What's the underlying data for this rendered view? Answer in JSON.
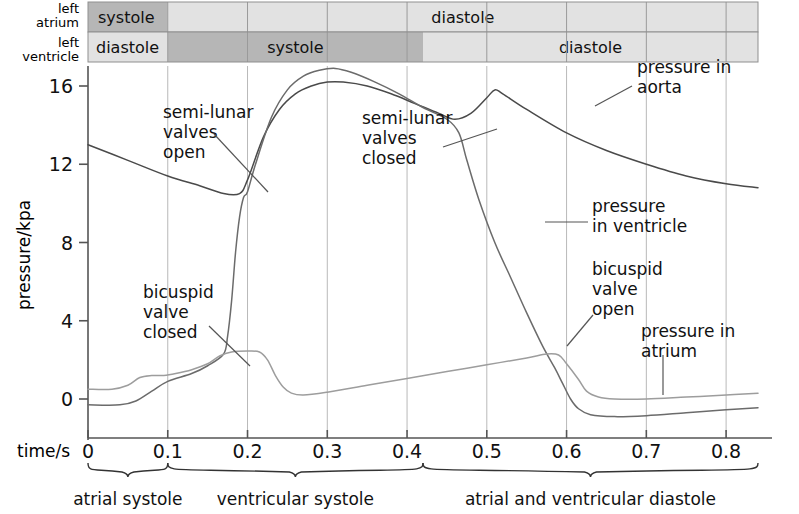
{
  "figure": {
    "axes": {
      "ylabel": "pressure/kpa",
      "xlabel": "time/s",
      "yticks": [
        "0",
        "4",
        "8",
        "12",
        "16"
      ],
      "xticks": [
        "0",
        "0.1",
        "0.2",
        "0.3",
        "0.4",
        "0.5",
        "0.6",
        "0.7",
        "0.8"
      ],
      "ylim": [
        -1.6,
        18.2
      ],
      "xlim": [
        0,
        0.84
      ]
    },
    "phase_rows": [
      {
        "row_label": "left atrium",
        "row_label_line1": "left",
        "row_label_line2": "atrium",
        "segments": [
          {
            "label": "systole",
            "start": 0.0,
            "end": 0.1,
            "shade": "dark"
          },
          {
            "label": "diastole",
            "start": 0.1,
            "end": 0.84,
            "shade": "light"
          }
        ]
      },
      {
        "row_label": "left ventricle",
        "row_label_line1": "left",
        "row_label_line2": "ventricle",
        "segments": [
          {
            "label": "diastole",
            "start": 0.0,
            "end": 0.1,
            "shade": "light"
          },
          {
            "label": "systole",
            "start": 0.1,
            "end": 0.42,
            "shade": "dark"
          },
          {
            "label": "diastole",
            "start": 0.42,
            "end": 0.84,
            "shade": "light"
          }
        ]
      }
    ],
    "phase_brackets": [
      {
        "label": "atrial systole",
        "start": 0.0,
        "end": 0.1
      },
      {
        "label": "ventricular systole",
        "start": 0.1,
        "end": 0.42
      },
      {
        "label": "atrial and ventricular diastole",
        "start": 0.42,
        "end": 0.84
      }
    ],
    "annotations": [
      {
        "id": "semi-lunar-valves-open",
        "lines": [
          "semi-lunar",
          "valves",
          "open"
        ],
        "text_x": 163,
        "text_y": 118,
        "leader": [
          [
            214,
            134
          ],
          [
            268,
            192
          ]
        ]
      },
      {
        "id": "semi-lunar-valves-closed",
        "lines": [
          "semi-lunar",
          "valves",
          "closed"
        ],
        "text_x": 362,
        "text_y": 124,
        "leader": [
          [
            443,
            147
          ],
          [
            497,
            129
          ]
        ]
      },
      {
        "id": "bicuspid-valve-closed",
        "lines": [
          "bicuspid",
          "valve",
          "closed"
        ],
        "text_x": 143,
        "text_y": 298,
        "leader": [
          [
            209,
            326
          ],
          [
            250,
            366
          ]
        ]
      },
      {
        "id": "bicuspid-valve-open",
        "lines": [
          "bicuspid",
          "valve",
          "open"
        ],
        "text_x": 592,
        "text_y": 275,
        "leader": [
          [
            593,
            315
          ],
          [
            567,
            346
          ]
        ]
      },
      {
        "id": "pressure-in-aorta",
        "lines": [
          "pressure in",
          "aorta"
        ],
        "text_x": 637,
        "text_y": 73,
        "leader": [
          [
            632,
            86
          ],
          [
            595,
            106
          ]
        ]
      },
      {
        "id": "pressure-in-ventricle",
        "lines": [
          "pressure",
          "in ventricle"
        ],
        "text_x": 592,
        "text_y": 212,
        "leader": [
          [
            588,
            222
          ],
          [
            545,
            222
          ]
        ]
      },
      {
        "id": "pressure-in-atrium",
        "lines": [
          "pressure in",
          "atrium"
        ],
        "text_x": 641,
        "text_y": 337,
        "leader": [
          [
            663,
            355
          ],
          [
            663,
            395
          ]
        ]
      }
    ],
    "chart_data": {
      "type": "line",
      "title": "Pressure changes in the left atrium, left ventricle and aorta during one cardiac cycle",
      "xlabel": "time/s",
      "ylabel": "pressure/kpa",
      "xlim": [
        0,
        0.84
      ],
      "ylim": [
        -1.6,
        18.2
      ],
      "xticks": [
        0,
        0.1,
        0.2,
        0.3,
        0.4,
        0.5,
        0.6,
        0.7,
        0.8
      ],
      "yticks": [
        0,
        4,
        8,
        12,
        16
      ],
      "grid": "vertical gridlines at each 0.1 s tick",
      "legend": "inline annotations (no legend box)",
      "series": [
        {
          "name": "pressure in aorta",
          "color": "#4a4a4a",
          "points": [
            [
              0.0,
              13.0
            ],
            [
              0.05,
              12.2
            ],
            [
              0.1,
              11.4
            ],
            [
              0.14,
              10.9
            ],
            [
              0.17,
              10.5
            ],
            [
              0.19,
              10.5
            ],
            [
              0.2,
              11.2
            ],
            [
              0.22,
              13.4
            ],
            [
              0.24,
              14.8
            ],
            [
              0.26,
              15.6
            ],
            [
              0.28,
              16.0
            ],
            [
              0.3,
              16.2
            ],
            [
              0.32,
              16.2
            ],
            [
              0.35,
              16.0
            ],
            [
              0.38,
              15.6
            ],
            [
              0.41,
              15.1
            ],
            [
              0.44,
              14.6
            ],
            [
              0.46,
              14.3
            ],
            [
              0.48,
              14.6
            ],
            [
              0.5,
              15.4
            ],
            [
              0.51,
              15.8
            ],
            [
              0.52,
              15.6
            ],
            [
              0.55,
              14.8
            ],
            [
              0.6,
              13.6
            ],
            [
              0.65,
              12.7
            ],
            [
              0.7,
              12.0
            ],
            [
              0.75,
              11.4
            ],
            [
              0.8,
              11.0
            ],
            [
              0.84,
              10.8
            ]
          ]
        },
        {
          "name": "pressure in ventricle",
          "color": "#6b6b6b",
          "points": [
            [
              0.0,
              -0.3
            ],
            [
              0.04,
              -0.3
            ],
            [
              0.06,
              -0.1
            ],
            [
              0.08,
              0.4
            ],
            [
              0.1,
              0.9
            ],
            [
              0.13,
              1.3
            ],
            [
              0.15,
              1.7
            ],
            [
              0.17,
              2.3
            ],
            [
              0.175,
              3.2
            ],
            [
              0.18,
              5.0
            ],
            [
              0.185,
              7.5
            ],
            [
              0.19,
              9.3
            ],
            [
              0.195,
              10.3
            ],
            [
              0.2,
              10.6
            ],
            [
              0.21,
              12.0
            ],
            [
              0.23,
              14.4
            ],
            [
              0.25,
              15.8
            ],
            [
              0.27,
              16.5
            ],
            [
              0.29,
              16.8
            ],
            [
              0.31,
              16.9
            ],
            [
              0.33,
              16.7
            ],
            [
              0.36,
              16.2
            ],
            [
              0.39,
              15.6
            ],
            [
              0.42,
              14.9
            ],
            [
              0.45,
              14.3
            ],
            [
              0.465,
              13.6
            ],
            [
              0.475,
              12.2
            ],
            [
              0.49,
              10.2
            ],
            [
              0.51,
              8.0
            ],
            [
              0.53,
              6.2
            ],
            [
              0.55,
              4.4
            ],
            [
              0.57,
              2.7
            ],
            [
              0.585,
              1.6
            ],
            [
              0.595,
              0.8
            ],
            [
              0.605,
              0.0
            ],
            [
              0.615,
              -0.5
            ],
            [
              0.63,
              -0.8
            ],
            [
              0.66,
              -0.9
            ],
            [
              0.7,
              -0.85
            ],
            [
              0.75,
              -0.7
            ],
            [
              0.8,
              -0.55
            ],
            [
              0.84,
              -0.45
            ]
          ]
        },
        {
          "name": "pressure in atrium",
          "color": "#9d9d9d",
          "points": [
            [
              0.0,
              0.5
            ],
            [
              0.03,
              0.5
            ],
            [
              0.05,
              0.7
            ],
            [
              0.065,
              1.1
            ],
            [
              0.08,
              1.2
            ],
            [
              0.095,
              1.2
            ],
            [
              0.11,
              1.3
            ],
            [
              0.13,
              1.5
            ],
            [
              0.15,
              1.8
            ],
            [
              0.165,
              2.2
            ],
            [
              0.18,
              2.4
            ],
            [
              0.2,
              2.45
            ],
            [
              0.215,
              2.4
            ],
            [
              0.225,
              2.0
            ],
            [
              0.235,
              1.2
            ],
            [
              0.245,
              0.6
            ],
            [
              0.255,
              0.3
            ],
            [
              0.27,
              0.2
            ],
            [
              0.3,
              0.35
            ],
            [
              0.35,
              0.7
            ],
            [
              0.4,
              1.05
            ],
            [
              0.45,
              1.4
            ],
            [
              0.5,
              1.75
            ],
            [
              0.55,
              2.1
            ],
            [
              0.575,
              2.3
            ],
            [
              0.59,
              2.25
            ],
            [
              0.6,
              1.8
            ],
            [
              0.615,
              1.0
            ],
            [
              0.625,
              0.4
            ],
            [
              0.64,
              0.1
            ],
            [
              0.66,
              0.0
            ],
            [
              0.7,
              0.0
            ],
            [
              0.75,
              0.1
            ],
            [
              0.8,
              0.2
            ],
            [
              0.84,
              0.3
            ]
          ]
        }
      ]
    }
  },
  "colors": {
    "shade_dark": "#b6b6b6",
    "shade_light": "#e2e2e2",
    "grid": "#b9b9b9",
    "axis": "#555555",
    "text": "#111111"
  }
}
